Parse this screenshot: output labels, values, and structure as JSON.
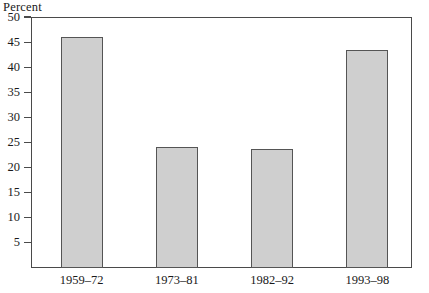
{
  "chart_data": {
    "type": "bar",
    "title": "",
    "subtitle": "",
    "ylabel": "Percent",
    "xlabel": "",
    "categories": [
      "1959–72",
      "1973–81",
      "1982–92",
      "1993–98"
    ],
    "values": [
      46.0,
      24.2,
      23.7,
      43.5
    ],
    "ylim": [
      0,
      50
    ],
    "yticks": [
      5,
      10,
      15,
      20,
      25,
      30,
      35,
      40,
      45,
      50
    ],
    "ytick_labels": [
      "5",
      "10",
      "15",
      "20",
      "25",
      "30",
      "35",
      "40",
      "45",
      "50"
    ],
    "grid": false,
    "legend": false,
    "legend_position": "none",
    "bar_fill_color": "#cfcfcf",
    "bar_border_color": "#555555",
    "axis_color": "#4a4a4a",
    "background_color": "#ffffff"
  }
}
